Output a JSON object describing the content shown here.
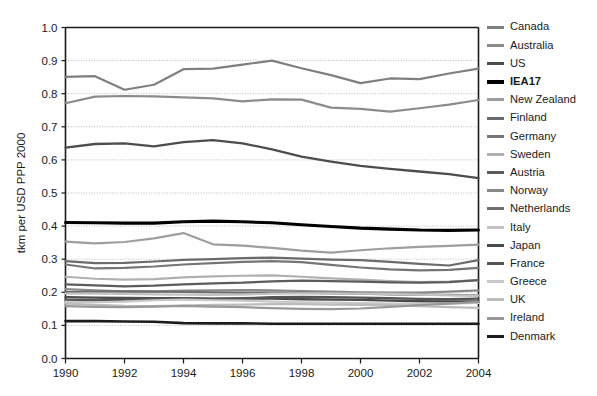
{
  "chart_data": {
    "type": "line",
    "title": "",
    "xlabel": "",
    "ylabel": "tkm per USD PPP 2000",
    "xlim": [
      1990,
      2004
    ],
    "ylim": [
      0.0,
      1.0
    ],
    "grid": "horizontal-dotted",
    "legend_position": "right",
    "x": [
      1990,
      1991,
      1992,
      1993,
      1994,
      1995,
      1996,
      1997,
      1998,
      1999,
      2000,
      2001,
      2002,
      2003,
      2004
    ],
    "x_ticks": [
      "1990",
      "1992",
      "1994",
      "1996",
      "1998",
      "2000",
      "2002",
      "2004"
    ],
    "y_ticks": [
      "0.0",
      "0.1",
      "0.2",
      "0.3",
      "0.4",
      "0.5",
      "0.6",
      "0.7",
      "0.8",
      "0.9",
      "1.0"
    ],
    "series": [
      {
        "name": "Canada",
        "color": "#7f7f7f",
        "width": 2.2,
        "values": [
          0.851,
          0.853,
          0.812,
          0.827,
          0.874,
          0.876,
          0.888,
          0.9,
          0.877,
          0.856,
          0.832,
          0.846,
          0.844,
          0.861,
          0.876
        ]
      },
      {
        "name": "Australia",
        "color": "#8c8c8c",
        "width": 2.2,
        "values": [
          0.771,
          0.791,
          0.793,
          0.792,
          0.789,
          0.786,
          0.777,
          0.783,
          0.782,
          0.758,
          0.754,
          0.746,
          0.756,
          0.767,
          0.781
        ]
      },
      {
        "name": "US",
        "color": "#4d4d4d",
        "width": 2.3,
        "values": [
          0.637,
          0.648,
          0.65,
          0.641,
          0.654,
          0.66,
          0.65,
          0.632,
          0.61,
          0.595,
          0.582,
          0.573,
          0.565,
          0.557,
          0.545
        ]
      },
      {
        "name": "IEA17",
        "color": "#000000",
        "width": 3.1,
        "values": [
          0.411,
          0.41,
          0.409,
          0.409,
          0.413,
          0.415,
          0.413,
          0.41,
          0.404,
          0.399,
          0.394,
          0.391,
          0.388,
          0.387,
          0.388
        ]
      },
      {
        "name": "New Zealand",
        "color": "#9e9e9e",
        "width": 2.2,
        "values": [
          0.353,
          0.348,
          0.352,
          0.363,
          0.379,
          0.345,
          0.341,
          0.334,
          0.326,
          0.32,
          0.327,
          0.333,
          0.337,
          0.34,
          0.344
        ]
      },
      {
        "name": "Finland",
        "color": "#6b6b6b",
        "width": 2.2,
        "values": [
          0.294,
          0.288,
          0.289,
          0.293,
          0.298,
          0.3,
          0.303,
          0.305,
          0.302,
          0.299,
          0.297,
          0.292,
          0.286,
          0.281,
          0.297
        ]
      },
      {
        "name": "Germany",
        "color": "#757575",
        "width": 2.2,
        "values": [
          0.284,
          0.272,
          0.274,
          0.278,
          0.284,
          0.288,
          0.292,
          0.294,
          0.291,
          0.283,
          0.275,
          0.269,
          0.266,
          0.268,
          0.274
        ]
      },
      {
        "name": "Sweden",
        "color": "#b0b0b0",
        "width": 2.2,
        "values": [
          0.247,
          0.241,
          0.238,
          0.24,
          0.245,
          0.248,
          0.25,
          0.251,
          0.247,
          0.242,
          0.238,
          0.234,
          0.231,
          0.232,
          0.237
        ]
      },
      {
        "name": "Austria",
        "color": "#5c5c5c",
        "width": 2.2,
        "values": [
          0.224,
          0.221,
          0.218,
          0.22,
          0.224,
          0.227,
          0.229,
          0.233,
          0.235,
          0.234,
          0.232,
          0.23,
          0.229,
          0.231,
          0.237
        ]
      },
      {
        "name": "Norway",
        "color": "#8a8a8a",
        "width": 2.2,
        "values": [
          0.21,
          0.206,
          0.203,
          0.203,
          0.205,
          0.206,
          0.207,
          0.206,
          0.204,
          0.202,
          0.2,
          0.199,
          0.199,
          0.202,
          0.206
        ]
      },
      {
        "name": "Netherlands",
        "color": "#6e6e6e",
        "width": 2.2,
        "values": [
          0.201,
          0.202,
          0.203,
          0.202,
          0.201,
          0.2,
          0.199,
          0.199,
          0.198,
          0.197,
          0.196,
          0.194,
          0.193,
          0.192,
          0.191
        ]
      },
      {
        "name": "Italy",
        "color": "#c2c2c2",
        "width": 2.2,
        "values": [
          0.196,
          0.196,
          0.195,
          0.194,
          0.193,
          0.192,
          0.193,
          0.196,
          0.197,
          0.197,
          0.196,
          0.195,
          0.193,
          0.191,
          0.19
        ]
      },
      {
        "name": "Japan",
        "color": "#4a4a4a",
        "width": 2.4,
        "values": [
          0.185,
          0.184,
          0.183,
          0.182,
          0.182,
          0.181,
          0.181,
          0.181,
          0.179,
          0.178,
          0.177,
          0.175,
          0.173,
          0.172,
          0.172
        ]
      },
      {
        "name": "France",
        "color": "#555555",
        "width": 2.3,
        "values": [
          0.176,
          0.176,
          0.178,
          0.179,
          0.181,
          0.18,
          0.182,
          0.185,
          0.186,
          0.185,
          0.184,
          0.182,
          0.18,
          0.179,
          0.181
        ]
      },
      {
        "name": "Greece",
        "color": "#c8c8c8",
        "width": 2.2,
        "values": [
          0.171,
          0.17,
          0.172,
          0.176,
          0.178,
          0.176,
          0.175,
          0.172,
          0.17,
          0.169,
          0.167,
          0.166,
          0.165,
          0.166,
          0.168
        ]
      },
      {
        "name": "UK",
        "color": "#bcbcbc",
        "width": 2.2,
        "values": [
          0.166,
          0.162,
          0.159,
          0.158,
          0.16,
          0.162,
          0.163,
          0.164,
          0.164,
          0.163,
          0.162,
          0.161,
          0.158,
          0.155,
          0.153
        ]
      },
      {
        "name": "Ireland",
        "color": "#999999",
        "width": 2.2,
        "values": [
          0.158,
          0.156,
          0.155,
          0.157,
          0.159,
          0.157,
          0.155,
          0.152,
          0.15,
          0.149,
          0.151,
          0.156,
          0.161,
          0.166,
          0.171
        ]
      },
      {
        "name": "Denmark",
        "color": "#1c1c1c",
        "width": 2.6,
        "values": [
          0.113,
          0.113,
          0.112,
          0.111,
          0.107,
          0.106,
          0.106,
          0.105,
          0.105,
          0.105,
          0.105,
          0.105,
          0.105,
          0.105,
          0.105
        ]
      }
    ]
  },
  "legend": {
    "items": [
      {
        "label": "Canada",
        "color": "#7f7f7f",
        "bold": false
      },
      {
        "label": "Australia",
        "color": "#8c8c8c",
        "bold": false
      },
      {
        "label": "US",
        "color": "#4d4d4d",
        "bold": false
      },
      {
        "label": "IEA17",
        "color": "#000000",
        "bold": true
      },
      {
        "label": "New Zealand",
        "color": "#9e9e9e",
        "bold": false
      },
      {
        "label": "Finland",
        "color": "#6b6b6b",
        "bold": false
      },
      {
        "label": "Germany",
        "color": "#757575",
        "bold": false
      },
      {
        "label": "Sweden",
        "color": "#b0b0b0",
        "bold": false
      },
      {
        "label": "Austria",
        "color": "#5c5c5c",
        "bold": false
      },
      {
        "label": "Norway",
        "color": "#8a8a8a",
        "bold": false
      },
      {
        "label": "Netherlands",
        "color": "#6e6e6e",
        "bold": false
      },
      {
        "label": "Italy",
        "color": "#c2c2c2",
        "bold": false
      },
      {
        "label": "Japan",
        "color": "#4a4a4a",
        "bold": false
      },
      {
        "label": "France",
        "color": "#555555",
        "bold": false
      },
      {
        "label": "Greece",
        "color": "#c8c8c8",
        "bold": false
      },
      {
        "label": "UK",
        "color": "#bcbcbc",
        "bold": false
      },
      {
        "label": "Ireland",
        "color": "#999999",
        "bold": false
      },
      {
        "label": "Denmark",
        "color": "#1c1c1c",
        "bold": false
      }
    ]
  },
  "axes": {
    "y_title": "tkm per USD PPP 2000",
    "axis_color": "#1a1a1a",
    "grid_color": "#aaaaaa"
  }
}
